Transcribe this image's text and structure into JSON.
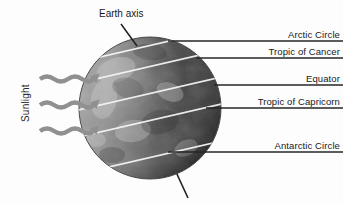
{
  "figure": {
    "background_color": "#fdfdfd"
  },
  "globe": {
    "name": "earth-globe",
    "center_x": 150,
    "center_y": 108,
    "radius": 71,
    "lit_side_color": "#8d8d8d",
    "dark_side_color": "#2e2e2e",
    "latitude_line_color": "#f2f2f2"
  },
  "axis": {
    "label": "Earth axis",
    "label_x": 99,
    "label_y": 8,
    "leader_color": "#1a1a1a",
    "tilt_degrees": 23.5
  },
  "sunlight": {
    "label": "Sunlight",
    "arrow_color": "#8f8f8f",
    "arrow_count": 3,
    "arrow_ys": [
      79,
      105,
      131
    ]
  },
  "latitude_labels": [
    {
      "name": "arctic-circle",
      "text": "Arctic Circle",
      "line_y": 41,
      "text_y": 29
    },
    {
      "name": "tropic-of-cancer",
      "text": "Tropic of Cancer",
      "line_y": 58,
      "text_y": 46
    },
    {
      "name": "equator",
      "text": "Equator",
      "line_y": 85,
      "text_y": 73
    },
    {
      "name": "tropic-of-capricorn",
      "text": "Tropic of Capricorn",
      "line_y": 108,
      "text_y": 96
    },
    {
      "name": "antarctic-circle",
      "text": "Antarctic Circle",
      "line_y": 152,
      "text_y": 140
    }
  ],
  "colors": {
    "leader_line": "#262626",
    "text": "#1a1a1a",
    "arrow": "#909090"
  }
}
